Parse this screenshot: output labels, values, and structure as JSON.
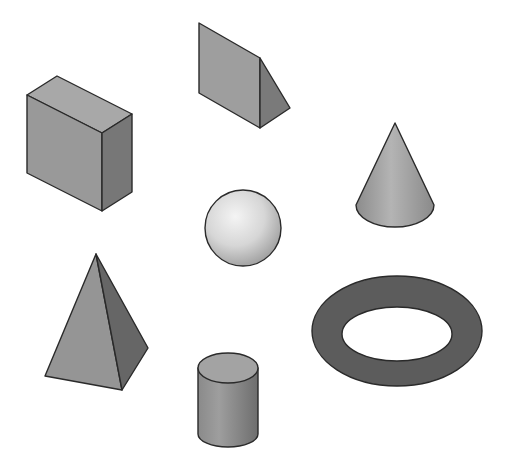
{
  "shapes": [
    {
      "id": "box",
      "label": "Box"
    },
    {
      "id": "wedge",
      "label": "Wedge"
    },
    {
      "id": "cone",
      "label": "Cone"
    },
    {
      "id": "sphere",
      "label": "Sphere"
    },
    {
      "id": "pyramid",
      "label": "Pyramid"
    },
    {
      "id": "cylinder",
      "label": "Cylinder"
    },
    {
      "id": "torus",
      "label": "Torus"
    }
  ],
  "colors": {
    "background": "#ffffff",
    "face_light": "#a6a6a6",
    "face_mid": "#8f8f8f",
    "face_dark": "#6a6a6a",
    "torus": "#5a5a5a",
    "edge": "#2a2a2a"
  }
}
